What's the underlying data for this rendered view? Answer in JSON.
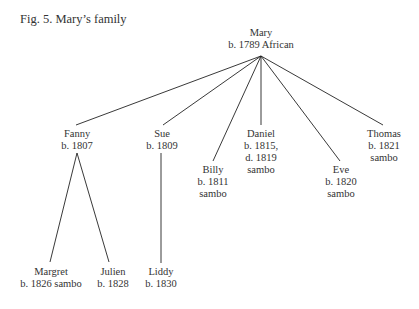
{
  "caption": "Fig. 5. Mary’s family",
  "nodes": {
    "mary": {
      "name": "Mary",
      "lines": [
        "b. 1789 African"
      ]
    },
    "fanny": {
      "name": "Fanny",
      "lines": [
        "b. 1807"
      ]
    },
    "sue": {
      "name": "Sue",
      "lines": [
        "b. 1809"
      ]
    },
    "billy": {
      "name": "Billy",
      "lines": [
        "b. 1811",
        "sambo"
      ]
    },
    "daniel": {
      "name": "Daniel",
      "lines": [
        "b. 1815,",
        "d. 1819",
        "sambo"
      ]
    },
    "eve": {
      "name": "Eve",
      "lines": [
        "b. 1820",
        "sambo"
      ]
    },
    "thomas": {
      "name": "Thomas",
      "lines": [
        "b. 1821",
        "sambo"
      ]
    },
    "margret": {
      "name": "Margret",
      "lines": [
        "b. 1826 sambo"
      ]
    },
    "julien": {
      "name": "Julien",
      "lines": [
        "b. 1828"
      ]
    },
    "liddy": {
      "name": "Liddy",
      "lines": [
        "b. 1830"
      ]
    }
  },
  "edges": [
    [
      "mary",
      "fanny"
    ],
    [
      "mary",
      "sue"
    ],
    [
      "mary",
      "billy"
    ],
    [
      "mary",
      "daniel"
    ],
    [
      "mary",
      "eve"
    ],
    [
      "mary",
      "thomas"
    ],
    [
      "fanny",
      "margret"
    ],
    [
      "fanny",
      "julien"
    ],
    [
      "sue",
      "liddy"
    ]
  ]
}
